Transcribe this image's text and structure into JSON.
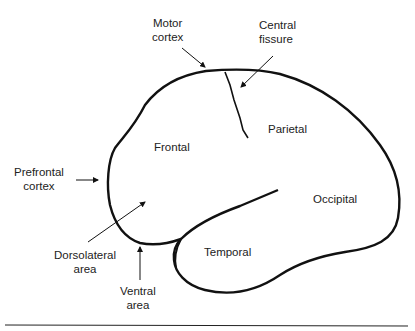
{
  "diagram": {
    "type": "brain-lateral-view",
    "labels": {
      "motor_cortex": [
        "Motor",
        "cortex"
      ],
      "central_fissure": [
        "Central",
        "fissure"
      ],
      "prefrontal_cortex": [
        "Prefrontal",
        "cortex"
      ],
      "frontal": "Frontal",
      "parietal": "Parietal",
      "occipital": "Occipital",
      "temporal": "Temporal",
      "dorsolateral_area": [
        "Dorsolateral",
        "area"
      ],
      "ventral_area": [
        "Ventral",
        "area"
      ]
    },
    "colors": {
      "stroke": "#111111",
      "text": "#222222",
      "background": "#ffffff"
    }
  }
}
